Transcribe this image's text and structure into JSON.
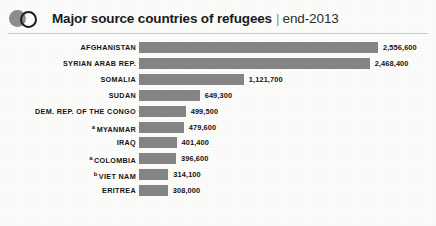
{
  "header": {
    "logo_disc": "filled-circle",
    "logo_ring": "outline-circle",
    "title": "Major source countries of refugees",
    "separator": "|",
    "subtitle": "end-2013"
  },
  "colors": {
    "bar": "#848484",
    "logo_disc": "#8c8c8c",
    "logo_ring": "#1c1c1c",
    "text": "#141414",
    "rule": "#c9c9c9",
    "background": "#fcfcfb"
  },
  "chart_data": {
    "type": "bar",
    "orientation": "horizontal",
    "title": "Major source countries of refugees",
    "subtitle": "end-2013",
    "xlabel": "",
    "ylabel": "",
    "grid": false,
    "legend": false,
    "xlim": [
      0,
      2556600
    ],
    "categories": [
      "AFGHANISTAN",
      "SYRIAN ARAB REP.",
      "SOMALIA",
      "SUDAN",
      "DEM. REP. OF THE CONGO",
      "MYANMAR",
      "IRAQ",
      "COLOMBIA",
      "VIET NAM",
      "ERITREA"
    ],
    "values": [
      2556600,
      2468400,
      1121700,
      649300,
      499500,
      479600,
      401400,
      396600,
      314100,
      308000
    ],
    "value_labels": [
      "2,556,600",
      "2,468,400",
      "1,121,700",
      "649,300",
      "499,500",
      "479,600",
      "401,400",
      "396,600",
      "314,100",
      "308,000"
    ],
    "footnote_markers": [
      "",
      "",
      "",
      "",
      "",
      "a",
      "",
      "a",
      "b",
      ""
    ]
  },
  "rows": [
    {
      "label": "AFGHANISTAN",
      "marker": "",
      "value_label": "2,556,600",
      "value": 2556600
    },
    {
      "label": "SYRIAN ARAB REP.",
      "marker": "",
      "value_label": "2,468,400",
      "value": 2468400
    },
    {
      "label": "SOMALIA",
      "marker": "",
      "value_label": "1,121,700",
      "value": 1121700
    },
    {
      "label": "SUDAN",
      "marker": "",
      "value_label": "649,300",
      "value": 649300
    },
    {
      "label": "DEM. REP. OF THE CONGO",
      "marker": "",
      "value_label": "499,500",
      "value": 499500
    },
    {
      "label": "MYANMAR",
      "marker": "a",
      "value_label": "479,600",
      "value": 479600
    },
    {
      "label": "IRAQ",
      "marker": "",
      "value_label": "401,400",
      "value": 401400
    },
    {
      "label": "COLOMBIA",
      "marker": "a",
      "value_label": "396,600",
      "value": 396600
    },
    {
      "label": "VIET NAM",
      "marker": "b",
      "value_label": "314,100",
      "value": 314100
    },
    {
      "label": "ERITREA",
      "marker": "",
      "value_label": "308,000",
      "value": 308000
    }
  ]
}
